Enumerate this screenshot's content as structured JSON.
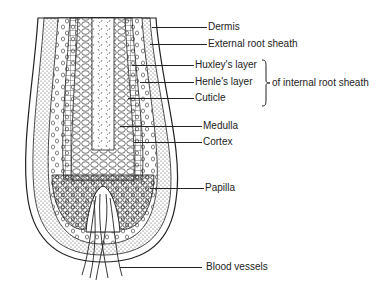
{
  "figure": {
    "colors": {
      "ink": "#222222",
      "background": "#ffffff",
      "stipple": "#555555"
    }
  },
  "labels": [
    {
      "id": "dermis",
      "text": "Dermis",
      "y": 27,
      "line_x1": 152,
      "line_x2": 207
    },
    {
      "id": "external-root-sheath",
      "text": "External root sheath",
      "y": 44,
      "line_x1": 150,
      "line_x2": 207
    },
    {
      "id": "huxleys-layer",
      "text": "Huxley's layer",
      "y": 65,
      "line_x1": 132,
      "line_x2": 194
    },
    {
      "id": "henles-layer",
      "text": "Henle's layer",
      "y": 82,
      "line_x1": 140,
      "line_x2": 194
    },
    {
      "id": "cuticle",
      "text": "Cuticle",
      "y": 98,
      "line_x1": 128,
      "line_x2": 194
    },
    {
      "id": "medulla",
      "text": "Medulla",
      "y": 126,
      "line_x1": 120,
      "line_x2": 202
    },
    {
      "id": "cortex",
      "text": "Cortex",
      "y": 142,
      "line_x1": 134,
      "line_x2": 202
    },
    {
      "id": "papilla",
      "text": "Papilla",
      "y": 188,
      "line_x1": 150,
      "line_x2": 204
    },
    {
      "id": "blood-vessels",
      "text": "Blood vessels",
      "y": 267,
      "line_x1": 120,
      "line_x2": 202
    }
  ],
  "bracket": {
    "text": "of internal root sheath",
    "groups": [
      "huxleys-layer",
      "henles-layer",
      "cuticle"
    ],
    "x": 262,
    "y1": 60,
    "y2": 106
  }
}
